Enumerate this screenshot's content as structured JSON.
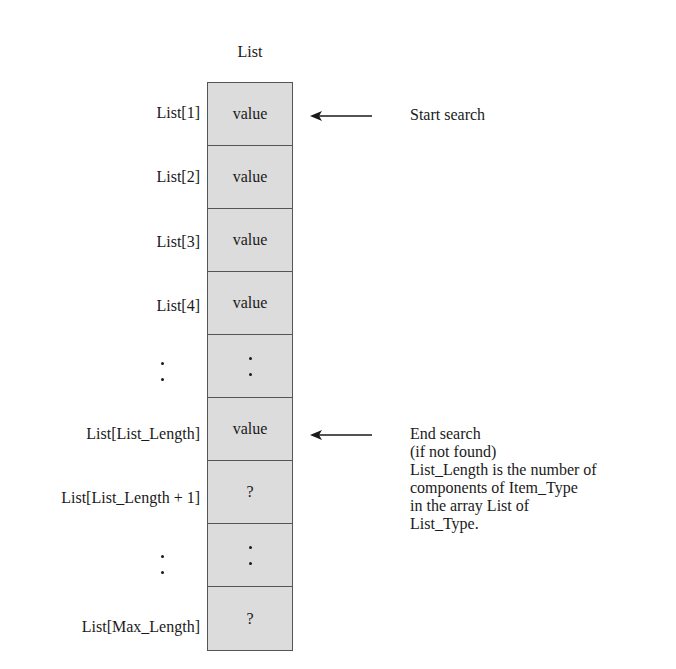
{
  "diagram": {
    "title": "List",
    "cells": [
      {
        "index_label": "List[1]",
        "content": "value",
        "type": "text"
      },
      {
        "index_label": "List[2]",
        "content": "value",
        "type": "text"
      },
      {
        "index_label": "List[3]",
        "content": "value",
        "type": "text"
      },
      {
        "index_label": "List[4]",
        "content": "value",
        "type": "text"
      },
      {
        "index_label": "",
        "content": "",
        "type": "ellipsis"
      },
      {
        "index_label": "List[List_Length]",
        "content": "value",
        "type": "text"
      },
      {
        "index_label": "List[List_Length + 1]",
        "content": "?",
        "type": "text"
      },
      {
        "index_label": "",
        "content": "",
        "type": "ellipsis"
      },
      {
        "index_label": "List[Max_Length]",
        "content": "?",
        "type": "text"
      }
    ],
    "annotations": {
      "start": {
        "cell_index": 0,
        "lines": [
          "Start search"
        ]
      },
      "end": {
        "cell_index": 5,
        "lines": [
          "End search",
          "(if not found)",
          "List_Length is the number of",
          "components of Item_Type",
          "in the array List of",
          "List_Type."
        ]
      }
    },
    "colors": {
      "cell_fill": "#dcdcdc",
      "border": "#555555",
      "text": "#1a1a1a"
    }
  }
}
